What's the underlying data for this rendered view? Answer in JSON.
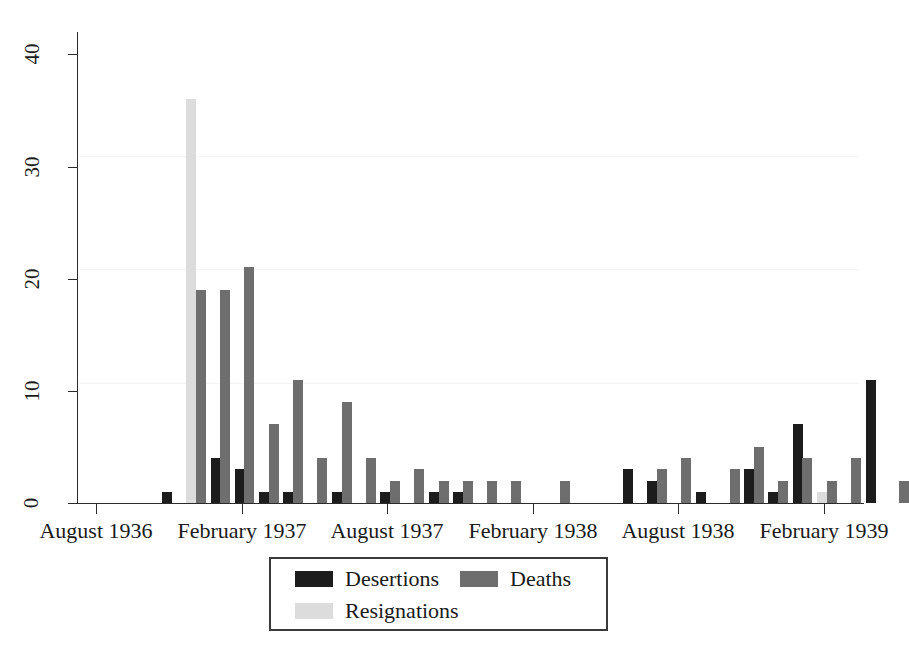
{
  "chart_data": {
    "type": "bar",
    "title": "",
    "subtitle": "",
    "xlabel": "",
    "ylabel": "",
    "ylim": [
      0,
      42
    ],
    "yticks": [
      0,
      10,
      20,
      30,
      40
    ],
    "grid": false,
    "legend_position": "below-center",
    "bar_mode": "grouped",
    "xtick_labels": [
      "August 1936",
      "February 1937",
      "August 1937",
      "February 1938",
      "August 1938",
      "February 1939"
    ],
    "xtick_months": [
      "1936-08",
      "1937-02",
      "1937-08",
      "1938-02",
      "1938-08",
      "1939-02"
    ],
    "series": [
      {
        "name": "Desertions",
        "color": "#1c1c1c",
        "values": [
          1,
          0,
          4,
          3,
          1,
          1,
          0,
          1,
          0,
          1,
          0,
          1,
          1,
          0,
          0,
          0,
          0,
          0,
          0,
          3,
          2,
          0,
          1,
          0,
          3,
          1,
          7,
          0,
          0,
          11,
          0
        ]
      },
      {
        "name": "Deaths",
        "color": "#6e6e6e",
        "values": [
          0,
          19,
          19,
          21,
          7,
          11,
          4,
          9,
          4,
          2,
          3,
          2,
          2,
          2,
          2,
          0,
          2,
          0,
          0,
          0,
          3,
          4,
          0,
          3,
          5,
          2,
          4,
          2,
          4,
          0,
          2
        ]
      },
      {
        "name": "Resignations",
        "color": "#dcdcdc",
        "values": [
          0,
          36,
          0,
          0,
          1,
          0,
          0,
          0,
          0,
          0,
          0,
          0,
          0,
          0,
          0,
          0,
          0,
          0,
          0,
          0,
          0,
          0,
          0,
          0,
          0,
          0,
          0,
          1,
          0,
          0,
          0
        ]
      }
    ],
    "categories": [
      "1936-08",
      "1936-09",
      "1936-10",
      "1936-11",
      "1936-12",
      "1937-01",
      "1937-02",
      "1937-03",
      "1937-04",
      "1937-05",
      "1937-06",
      "1937-07",
      "1937-08",
      "1937-09",
      "1937-10",
      "1937-11",
      "1937-12",
      "1938-01",
      "1938-02",
      "1938-03",
      "1938-04",
      "1938-05",
      "1938-06",
      "1938-07",
      "1938-08",
      "1938-09",
      "1938-10",
      "1938-11",
      "1938-12",
      "1939-01",
      "1939-02"
    ]
  },
  "legend": {
    "items": [
      {
        "label": "Desertions",
        "color": "#1c1c1c"
      },
      {
        "label": "Deaths",
        "color": "#6e6e6e"
      },
      {
        "label": "Resignations",
        "color": "#dcdcdc"
      }
    ]
  },
  "axis": {
    "y_tick_labels": [
      "0",
      "10",
      "20",
      "30",
      "40"
    ],
    "x_tick_labels": [
      "August 1936",
      "February 1937",
      "August 1937",
      "February 1938",
      "August 1938",
      "February 1939"
    ]
  }
}
